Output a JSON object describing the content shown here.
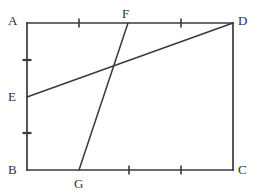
{
  "figure": {
    "type": "geometry-diagram",
    "background_color": "#ffffff",
    "stroke_color": "#3a3a3a",
    "label_color": "#2e2e2e",
    "stroke_width": 1.6,
    "canvas": {
      "width": 257,
      "height": 196
    },
    "points": [
      {
        "name": "A",
        "x": 27,
        "y": 23,
        "label_x": 8,
        "label_y": 14,
        "on": "rectangle-corner-top-left"
      },
      {
        "name": "D",
        "x": 233,
        "y": 23,
        "label_x": 238,
        "label_y": 14,
        "on": "rectangle-corner-top-right"
      },
      {
        "name": "B",
        "x": 27,
        "y": 170,
        "label_x": 8,
        "label_y": 163,
        "on": "rectangle-corner-bottom-left"
      },
      {
        "name": "C",
        "x": 233,
        "y": 170,
        "label_x": 238,
        "label_y": 163,
        "on": "rectangle-corner-bottom-right"
      },
      {
        "name": "E",
        "x": 27,
        "y": 97,
        "label_x": 8,
        "label_y": 90,
        "on": "side-AB"
      },
      {
        "name": "F",
        "x": 128,
        "y": 23,
        "label_x": 122,
        "label_y": 7,
        "on": "side-AD"
      },
      {
        "name": "G",
        "x": 79,
        "y": 170,
        "label_x": 74,
        "label_y": 177,
        "on": "side-BC"
      }
    ],
    "sides": [
      {
        "name": "side-AD",
        "from": "A",
        "to": "D"
      },
      {
        "name": "side-DC",
        "from": "D",
        "to": "C"
      },
      {
        "name": "side-CB",
        "from": "C",
        "to": "B"
      },
      {
        "name": "side-BA",
        "from": "B",
        "to": "A"
      }
    ],
    "segments": [
      {
        "name": "segment-ED",
        "from": "E",
        "to": "D",
        "x1": 27,
        "y1": 97,
        "x2": 233,
        "y2": 23
      },
      {
        "name": "segment-FG",
        "from": "F",
        "to": "G",
        "x1": 128,
        "y1": 23,
        "x2": 79,
        "y2": 170
      }
    ],
    "tick_marks": [
      {
        "name": "tick-AE-midpoint",
        "on": "side-AB",
        "orientation": "horizontal",
        "cx": 27,
        "cy": 60,
        "len": 9
      },
      {
        "name": "tick-EB-midpoint",
        "on": "side-AB",
        "orientation": "horizontal",
        "cx": 27,
        "cy": 133,
        "len": 9
      },
      {
        "name": "tick-AD-first",
        "on": "side-AD",
        "orientation": "vertical",
        "cx": 79,
        "cy": 23,
        "len": 9
      },
      {
        "name": "tick-AD-second",
        "on": "side-AD",
        "orientation": "vertical",
        "cx": 181,
        "cy": 23,
        "len": 9
      },
      {
        "name": "tick-BC-first",
        "on": "side-BC",
        "orientation": "vertical",
        "cx": 129,
        "cy": 170,
        "len": 9
      },
      {
        "name": "tick-BC-second",
        "on": "side-BC",
        "orientation": "vertical",
        "cx": 181,
        "cy": 170,
        "len": 9
      }
    ],
    "intersection": {
      "name": "intersection-ED-FG",
      "x": 113,
      "y": 68
    }
  }
}
